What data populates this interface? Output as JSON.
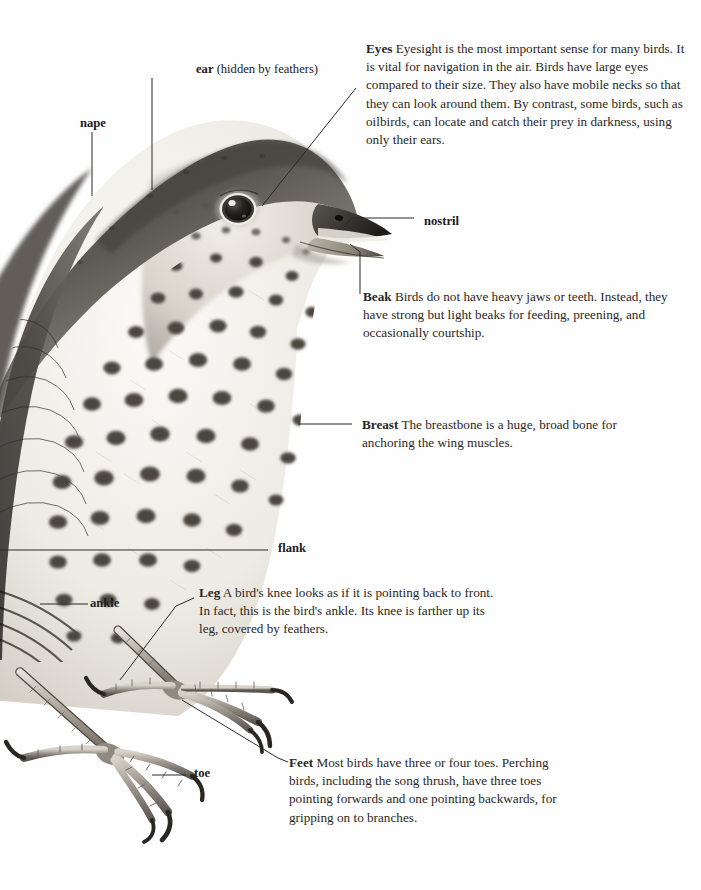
{
  "page": {
    "background": "#ffffff",
    "ink": "#2a2723",
    "illustration": "song-thrush-head-body-feet-pencil-drawing"
  },
  "labels": [
    {
      "id": "nape",
      "text": "nape",
      "sub": ""
    },
    {
      "id": "ear",
      "text": "ear",
      "sub": " (hidden by feathers)"
    },
    {
      "id": "nostril",
      "text": "nostril",
      "sub": ""
    },
    {
      "id": "flank",
      "text": "flank",
      "sub": ""
    },
    {
      "id": "ankle",
      "text": "ankle",
      "sub": ""
    },
    {
      "id": "toe",
      "text": "toe",
      "sub": ""
    }
  ],
  "callouts": [
    {
      "id": "eyes",
      "term": "Eyes",
      "body": "Eyesight is the most important sense for many birds. It is vital for navigation in the air. Birds have large eyes compared to their size. They also have mobile necks so that they can look around them. By contrast, some birds, such as oilbirds, can locate and catch their prey in darkness, using only their ears."
    },
    {
      "id": "beak",
      "term": "Beak",
      "body": "Birds do not have heavy jaws or teeth. Instead, they have strong but light beaks for feeding, preening, and occasionally courtship."
    },
    {
      "id": "breast",
      "term": "Breast",
      "body": "The breastbone is a huge, broad bone for anchoring the wing muscles."
    },
    {
      "id": "leg",
      "term": "Leg",
      "body": "A bird's knee looks as if it is pointing back to front. In fact, this is the bird's ankle. Its knee is farther up its leg, covered by feathers."
    },
    {
      "id": "feet",
      "term": "Feet",
      "body": "Most birds have three or four toes. Perching birds, including the song thrush, have three toes pointing forwards and one pointing backwards, for gripping on to branches."
    }
  ]
}
